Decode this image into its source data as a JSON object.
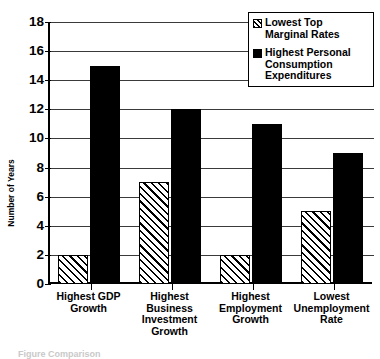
{
  "chart_data": {
    "type": "bar",
    "title": "",
    "xlabel": "",
    "ylabel": "Number of Years",
    "ylim": [
      0,
      18
    ],
    "ytick_step": 2,
    "ytick_labels": [
      "0",
      "2",
      "4",
      "6",
      "8",
      "10",
      "12",
      "14",
      "16",
      "18"
    ],
    "grid": true,
    "legend_position": "top-right",
    "categories": [
      "Highest GDP Growth",
      "Highest Business Investment Growth",
      "Highest Employment Growth",
      "Lowest Unemployment Rate"
    ],
    "category_lines": [
      [
        "Highest GDP",
        "Growth"
      ],
      [
        "Highest",
        "Business",
        "Investment",
        "Growth"
      ],
      [
        "Highest",
        "Employment",
        "Growth"
      ],
      [
        "Lowest",
        "Unemployment",
        "Rate"
      ]
    ],
    "series": [
      {
        "name": "Lowest Top Marginal Rates",
        "name_lines": [
          "Lowest Top",
          "Marginal Rates"
        ],
        "pattern": "diagonal-hatch",
        "color": "#ffffff",
        "values": [
          2,
          7,
          2,
          5
        ]
      },
      {
        "name": "Highest Personal Consumption Expenditures",
        "name_lines": [
          "Highest Personal",
          "Consumption",
          "Expenditures"
        ],
        "pattern": "solid",
        "color": "#000000",
        "values": [
          15,
          12,
          11,
          9
        ]
      }
    ]
  },
  "caption": {
    "text": "Figure  Comparison"
  }
}
